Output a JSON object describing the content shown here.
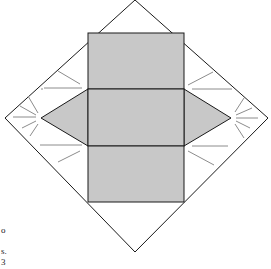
{
  "diagram": {
    "type": "net",
    "colors": {
      "background": "#ffffff",
      "face_fill": "#c8c8c8",
      "outline": "#1a1a1a",
      "crease": "#8c8c8c"
    },
    "outer_square": [
      [
        135,
        0
      ],
      [
        268,
        118
      ],
      [
        135,
        252
      ],
      [
        5,
        118
      ]
    ],
    "faces": {
      "top_rectangle": [
        [
          88,
          33
        ],
        [
          184,
          33
        ],
        [
          184,
          89
        ],
        [
          88,
          89
        ]
      ],
      "middle_rectangle": [
        [
          88,
          89
        ],
        [
          184,
          89
        ],
        [
          184,
          146
        ],
        [
          88,
          146
        ]
      ],
      "bottom_rectangle": [
        [
          88,
          146
        ],
        [
          184,
          146
        ],
        [
          184,
          202
        ],
        [
          88,
          202
        ]
      ],
      "left_triangle": [
        [
          88,
          89
        ],
        [
          41,
          118
        ],
        [
          88,
          146
        ]
      ],
      "right_triangle": [
        [
          184,
          89
        ],
        [
          231,
          118
        ],
        [
          184,
          146
        ]
      ]
    }
  },
  "text_fragments": [
    "o",
    "s.",
    "3"
  ]
}
